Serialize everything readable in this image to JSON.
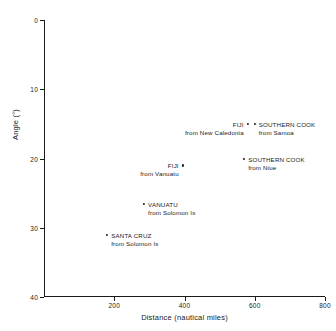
{
  "chart_data": {
    "type": "scatter",
    "title": "",
    "xlabel": "Distance (nautical miles)",
    "ylabel": "Angle (°)",
    "xlim": [
      0,
      800
    ],
    "ylim": [
      0,
      40
    ],
    "y_inverted": true,
    "grid": false,
    "legend": "none",
    "xticks": [
      200,
      400,
      600,
      800
    ],
    "xticklabels": [
      "200",
      "400",
      "600",
      "800"
    ],
    "yticks": [
      0,
      10,
      20,
      30,
      40
    ],
    "yticklabels": [
      "0",
      "10",
      "20",
      "30",
      "40"
    ],
    "points": [
      {
        "name": "FIJI",
        "origin": "from New Caledonia",
        "x": 580,
        "y": 15.0,
        "label_align": "left",
        "label_dx": -4,
        "label_dy": 1
      },
      {
        "name": "SOUTHERN COOK",
        "origin": "from Samoa",
        "x": 600,
        "y": 15.0,
        "label_align": "right",
        "label_dx": 4,
        "label_dy": 1
      },
      {
        "name": "SOUTHERN COOK",
        "origin": "from Niue",
        "x": 570,
        "y": 20.0,
        "label_align": "right",
        "label_dx": 4,
        "label_dy": 1
      },
      {
        "name": "FIJI",
        "origin": "from Vanuatu",
        "x": 395,
        "y": 21.0,
        "label_align": "left",
        "label_dx": -4,
        "label_dy": 1
      },
      {
        "name": "VANUATU",
        "origin": "from Solomon Is",
        "x": 285,
        "y": 26.5,
        "label_align": "right",
        "label_dx": 4,
        "label_dy": 1
      },
      {
        "name": "SANTA CRUZ",
        "origin": "from Solomon Is",
        "x": 180,
        "y": 31.0,
        "label_align": "right",
        "label_dx": 4,
        "label_dy": 1
      }
    ],
    "colors": {
      "axis": "#1a1a1a",
      "marker": "#1a1a1a",
      "text": "#1a1a1a",
      "background": "#ffffff"
    }
  }
}
